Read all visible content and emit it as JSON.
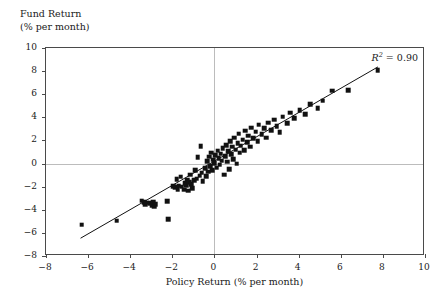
{
  "chart_data": {
    "type": "scatter",
    "title": "",
    "xlabel": "Policy Return (% per month)",
    "ylabel_line1": "Fund Return",
    "ylabel_line2": "(% per month)",
    "xlim": [
      -8,
      10
    ],
    "ylim": [
      -8,
      10
    ],
    "xticks": [
      -8,
      -6,
      -4,
      -2,
      0,
      2,
      4,
      6,
      8,
      10
    ],
    "xticklabels": [
      "−8",
      "−6",
      "−4",
      "−2",
      "0",
      "2",
      "4",
      "6",
      "8",
      "10"
    ],
    "yticks": [
      -8,
      -6,
      -4,
      -2,
      0,
      2,
      4,
      6,
      8,
      10
    ],
    "yticklabels": [
      "−8",
      "−6",
      "−4",
      "−2",
      "0",
      "2",
      "4",
      "6",
      "8",
      "10"
    ],
    "grid": "zero-lines-only",
    "gridlines": {
      "x": [
        0
      ],
      "y": [
        0
      ]
    },
    "legend": "none",
    "annotations": [
      {
        "name": "r-squared",
        "text_prefix": "R",
        "text_sup": "2",
        "text_suffix": " = 0.90",
        "value": 0.9,
        "position": "top-right-inside"
      }
    ],
    "marker": {
      "shape": "square",
      "color": "#111111",
      "size_px": 4.6
    },
    "fit_line": {
      "type": "linear-regression",
      "color": "#111111",
      "width_px": 1,
      "x_start": -6.35,
      "y_start": -6.62,
      "x_end": 7.85,
      "y_end": 8.35
    },
    "series": [
      {
        "name": "Fund vs Policy Return",
        "points": [
          [
            -6.3,
            -5.3
          ],
          [
            -4.65,
            -4.95
          ],
          [
            -3.45,
            -3.2
          ],
          [
            -3.35,
            -3.35
          ],
          [
            -3.3,
            -3.55
          ],
          [
            -3.25,
            -3.4
          ],
          [
            -3.05,
            -3.45
          ],
          [
            -2.95,
            -3.6
          ],
          [
            -2.9,
            -3.3
          ],
          [
            -2.85,
            -3.75
          ],
          [
            -2.8,
            -3.5
          ],
          [
            -2.25,
            -3.25
          ],
          [
            -2.2,
            -4.8
          ],
          [
            -1.95,
            -1.95
          ],
          [
            -1.85,
            -2.05
          ],
          [
            -1.8,
            -1.35
          ],
          [
            -1.75,
            -2.2
          ],
          [
            -1.7,
            -1.9
          ],
          [
            -1.6,
            -1.15
          ],
          [
            -1.55,
            -2.0
          ],
          [
            -1.45,
            -2.25
          ],
          [
            -1.4,
            -1.7
          ],
          [
            -1.35,
            -1.85
          ],
          [
            -1.3,
            -1.4
          ],
          [
            -1.25,
            -2.35
          ],
          [
            -1.2,
            -1.6
          ],
          [
            -1.15,
            -0.95
          ],
          [
            -1.1,
            -1.8
          ],
          [
            -1.05,
            -2.15
          ],
          [
            -0.95,
            -1.45
          ],
          [
            -0.9,
            -0.6
          ],
          [
            -0.85,
            -1.3
          ],
          [
            -0.8,
            0.55
          ],
          [
            -0.7,
            -1.05
          ],
          [
            -0.65,
            1.5
          ],
          [
            -0.6,
            -0.8
          ],
          [
            -0.55,
            -1.55
          ],
          [
            -0.45,
            -0.4
          ],
          [
            -0.4,
            -1.1
          ],
          [
            -0.35,
            0.2
          ],
          [
            -0.3,
            -0.7
          ],
          [
            -0.25,
            0.6
          ],
          [
            -0.2,
            -0.25
          ],
          [
            -0.15,
            0.95
          ],
          [
            -0.1,
            -0.55
          ],
          [
            -0.05,
            0.35
          ],
          [
            0.0,
            0.05
          ],
          [
            0.05,
            0.7
          ],
          [
            0.1,
            -0.35
          ],
          [
            0.15,
            1.1
          ],
          [
            0.2,
            0.45
          ],
          [
            0.25,
            -0.1
          ],
          [
            0.3,
            0.85
          ],
          [
            0.35,
            0.25
          ],
          [
            0.4,
            1.35
          ],
          [
            0.45,
            -0.95
          ],
          [
            0.5,
            0.65
          ],
          [
            0.55,
            1.6
          ],
          [
            0.6,
            0.15
          ],
          [
            0.65,
            1.05
          ],
          [
            0.7,
            -0.5
          ],
          [
            0.75,
            1.95
          ],
          [
            0.8,
            0.8
          ],
          [
            0.85,
            1.45
          ],
          [
            0.9,
            0.4
          ],
          [
            0.95,
            2.25
          ],
          [
            1.0,
            1.2
          ],
          [
            1.05,
            0.0
          ],
          [
            1.1,
            1.75
          ],
          [
            1.15,
            2.6
          ],
          [
            1.2,
            0.95
          ],
          [
            1.25,
            1.55
          ],
          [
            1.35,
            2.05
          ],
          [
            1.4,
            1.15
          ],
          [
            1.45,
            2.85
          ],
          [
            1.55,
            1.85
          ],
          [
            1.6,
            2.4
          ],
          [
            1.7,
            1.45
          ],
          [
            1.75,
            3.1
          ],
          [
            1.85,
            2.2
          ],
          [
            1.95,
            2.75
          ],
          [
            2.05,
            1.95
          ],
          [
            2.1,
            3.35
          ],
          [
            2.25,
            2.55
          ],
          [
            2.35,
            3.05
          ],
          [
            2.45,
            2.25
          ],
          [
            2.55,
            3.55
          ],
          [
            2.7,
            2.9
          ],
          [
            2.85,
            3.8
          ],
          [
            2.95,
            3.25
          ],
          [
            3.1,
            2.7
          ],
          [
            3.25,
            4.05
          ],
          [
            3.45,
            3.5
          ],
          [
            3.6,
            4.4
          ],
          [
            3.8,
            3.95
          ],
          [
            4.05,
            4.6
          ],
          [
            4.3,
            4.25
          ],
          [
            4.55,
            5.15
          ],
          [
            4.9,
            4.8
          ],
          [
            5.15,
            5.45
          ],
          [
            5.6,
            6.3
          ],
          [
            6.35,
            6.35
          ],
          [
            7.75,
            8.1
          ]
        ]
      }
    ]
  }
}
